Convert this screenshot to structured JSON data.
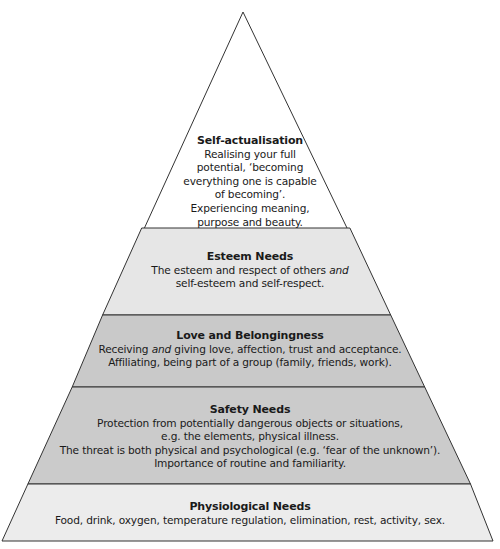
{
  "diagram": {
    "type": "pyramid",
    "tiers": [
      {
        "id": "self-actualisation",
        "title": "Self-actualisation",
        "lines": [
          "Realising your full",
          "potential, ‘becoming",
          "everything one is capable",
          "of becoming’.",
          "Experiencing meaning,",
          "purpose and beauty."
        ],
        "fill": "#ffffff"
      },
      {
        "id": "esteem",
        "title": "Esteem Needs",
        "lines": [
          "The esteem and respect of others",
          "and",
          "self-esteem and self-respect."
        ],
        "fill": "#e6e6e6"
      },
      {
        "id": "love",
        "title": "Love and Belongingness",
        "lines": [
          "Receiving",
          "and",
          "giving love, affection, trust and acceptance.",
          "Affiliating, being part of a group (family, friends, work)."
        ],
        "fill": "#c9c9c9"
      },
      {
        "id": "safety",
        "title": "Safety Needs",
        "lines": [
          "Protection from potentially dangerous objects or situations,",
          "e.g. the elements, physical illness.",
          "The threat is both physical and psychological (e.g. ‘fear of the unknown’).",
          "Importance of routine and familiarity."
        ],
        "fill": "#cbcbcb"
      },
      {
        "id": "physiological",
        "title": "Physiological Needs",
        "lines": [
          "Food, drink, oxygen, temperature regulation, elimination, rest, activity, sex."
        ],
        "fill": "#ececec"
      }
    ],
    "stroke": "#333333"
  }
}
